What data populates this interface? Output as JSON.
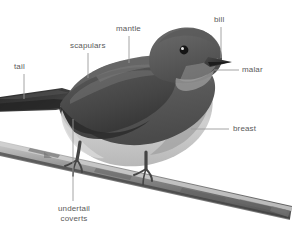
{
  "figure": {
    "kind": "annotated-bird-anatomy-diagram",
    "background_color": "#ffffff",
    "label_color": "#5a5a5a",
    "leader_color": "#9a9a9a"
  },
  "palette": {
    "upperparts_dark": "#4e4e4e",
    "upperparts_mid": "#6a6a6a",
    "head_dark": "#5c5c5c",
    "wing_dark": "#3c3c3c",
    "tail_dark": "#2e2e2e",
    "underparts_light": "#c9c9c9",
    "belly_pale": "#dcdcdc",
    "breast_mid": "#a8a8a8",
    "bill_dark": "#3a3a3a",
    "eye_dark": "#1a1a1a",
    "eye_highlight": "#f2f2f2",
    "leg_dark": "#4a4a4a",
    "branch_mid": "#8d8d8d",
    "branch_dark": "#5b5b5b",
    "branch_light": "#c4c4c4"
  },
  "labels": [
    {
      "id": "tail",
      "text": "tail",
      "x": 14,
      "y": 62,
      "leader": {
        "type": "vertical",
        "x": 24,
        "y1": 74,
        "y2": 99
      }
    },
    {
      "id": "scapulars",
      "text": "scapulars",
      "x": 70,
      "y": 41,
      "leader": {
        "type": "vertical",
        "x": 88,
        "y1": 53,
        "y2": 78
      }
    },
    {
      "id": "mantle",
      "text": "mantle",
      "x": 116,
      "y": 24,
      "leader": {
        "type": "vertical",
        "x": 129,
        "y1": 36,
        "y2": 63
      }
    },
    {
      "id": "bill",
      "text": "bill",
      "x": 214,
      "y": 15,
      "leader": {
        "type": "vertical",
        "x": 221,
        "y1": 27,
        "y2": 58
      }
    },
    {
      "id": "malar",
      "text": "malar",
      "x": 242,
      "y": 65,
      "leader": {
        "type": "horizontal",
        "y": 70,
        "x1": 214,
        "x2": 239
      }
    },
    {
      "id": "breast",
      "text": "breast",
      "x": 233,
      "y": 124,
      "leader": {
        "type": "horizontal",
        "y": 129,
        "x1": 191,
        "x2": 229
      }
    },
    {
      "id": "undertail-coverts",
      "text": "undertail coverts",
      "line1": "undertail",
      "line2": "coverts",
      "x": 54,
      "y": 204,
      "leader": {
        "type": "vertical",
        "x": 73,
        "y1": 119,
        "y2": 201
      }
    }
  ]
}
